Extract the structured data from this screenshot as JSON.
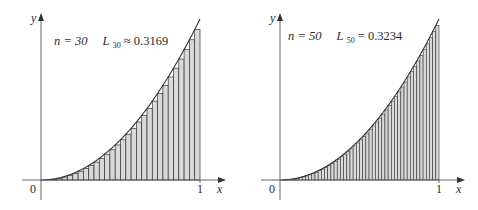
{
  "chart_data": [
    {
      "type": "bar",
      "subtype": "left-riemann-sum",
      "function": "y = x^2",
      "interval": [
        0,
        1
      ],
      "n": 30,
      "annotation": {
        "n_label": "n = 30",
        "sum_symbol": "L",
        "sum_subscript": "30",
        "relation": "≈",
        "value": "0.3169"
      },
      "xlabel": "x",
      "ylabel": "y",
      "x_ticks": [
        "0",
        "1"
      ],
      "xlim": [
        0,
        1
      ],
      "ylim": [
        0,
        1
      ],
      "grid": false,
      "fill_color": "#d9d9d9",
      "stroke_color": "#333333"
    },
    {
      "type": "bar",
      "subtype": "left-riemann-sum",
      "function": "y = x^2",
      "interval": [
        0,
        1
      ],
      "n": 50,
      "annotation": {
        "n_label": "n = 50",
        "sum_symbol": "L",
        "sum_subscript": "50",
        "relation": "=",
        "value": "0.3234"
      },
      "xlabel": "x",
      "ylabel": "y",
      "x_ticks": [
        "0",
        "1"
      ],
      "xlim": [
        0,
        1
      ],
      "ylim": [
        0,
        1
      ],
      "grid": false,
      "fill_color": "#d9d9d9",
      "stroke_color": "#333333"
    }
  ],
  "panels": [
    {
      "n_label": "n = 30",
      "sum_symbol": "L",
      "sum_subscript": "30",
      "relation_value": " ≈ 0.3169",
      "x_axis_label": "x",
      "y_axis_label": "y",
      "origin_label": "0",
      "one_label": "1"
    },
    {
      "n_label": "n = 50",
      "sum_symbol": "L",
      "sum_subscript": "50",
      "relation_value": " = 0.3234",
      "x_axis_label": "x",
      "y_axis_label": "y",
      "origin_label": "0",
      "one_label": "1"
    }
  ]
}
